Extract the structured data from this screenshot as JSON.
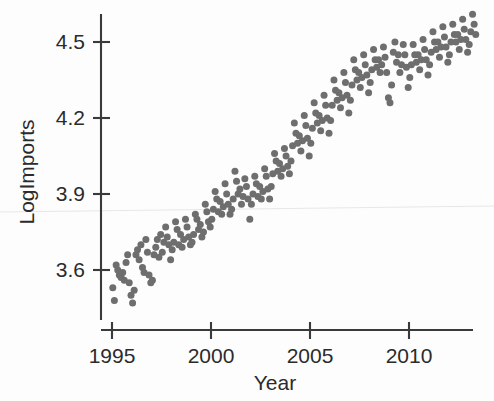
{
  "chart_data": {
    "type": "scatter",
    "title": "",
    "xlabel": "Year",
    "ylabel": "LogImports",
    "xlim": [
      1994.6,
      2013.6
    ],
    "ylim": [
      3.42,
      4.64
    ],
    "xticks": [
      1995,
      2000,
      2005,
      2010
    ],
    "xticklabels": [
      "1995",
      "2000",
      "2005",
      "2010"
    ],
    "yticks": [
      3.6,
      3.9,
      4.2,
      4.5
    ],
    "yticklabels": [
      "3.6",
      "3.9",
      "4.2",
      "4.5"
    ],
    "grid": false,
    "legend": null,
    "marker": {
      "shape": "circle",
      "color": "#6e6e6e",
      "size": 7
    },
    "points": [
      [
        1995.04,
        3.53
      ],
      [
        1995.12,
        3.48
      ],
      [
        1995.21,
        3.62
      ],
      [
        1995.29,
        3.6
      ],
      [
        1995.37,
        3.58
      ],
      [
        1995.46,
        3.57
      ],
      [
        1995.54,
        3.59
      ],
      [
        1995.62,
        3.56
      ],
      [
        1995.71,
        3.63
      ],
      [
        1995.79,
        3.66
      ],
      [
        1995.87,
        3.55
      ],
      [
        1995.96,
        3.5
      ],
      [
        1996.04,
        3.47
      ],
      [
        1996.12,
        3.52
      ],
      [
        1996.21,
        3.66
      ],
      [
        1996.29,
        3.68
      ],
      [
        1996.37,
        3.64
      ],
      [
        1996.46,
        3.7
      ],
      [
        1996.54,
        3.61
      ],
      [
        1996.62,
        3.59
      ],
      [
        1996.71,
        3.72
      ],
      [
        1996.79,
        3.67
      ],
      [
        1996.87,
        3.58
      ],
      [
        1996.96,
        3.55
      ],
      [
        1997.04,
        3.56
      ],
      [
        1997.12,
        3.66
      ],
      [
        1997.21,
        3.69
      ],
      [
        1997.29,
        3.72
      ],
      [
        1997.37,
        3.65
      ],
      [
        1997.46,
        3.74
      ],
      [
        1997.54,
        3.67
      ],
      [
        1997.62,
        3.71
      ],
      [
        1997.71,
        3.77
      ],
      [
        1997.79,
        3.73
      ],
      [
        1997.87,
        3.7
      ],
      [
        1997.96,
        3.64
      ],
      [
        1998.04,
        3.68
      ],
      [
        1998.12,
        3.71
      ],
      [
        1998.21,
        3.79
      ],
      [
        1998.29,
        3.76
      ],
      [
        1998.37,
        3.7
      ],
      [
        1998.46,
        3.74
      ],
      [
        1998.54,
        3.69
      ],
      [
        1998.62,
        3.72
      ],
      [
        1998.71,
        3.8
      ],
      [
        1998.79,
        3.77
      ],
      [
        1998.87,
        3.73
      ],
      [
        1998.96,
        3.7
      ],
      [
        1999.04,
        3.71
      ],
      [
        1999.12,
        3.74
      ],
      [
        1999.21,
        3.82
      ],
      [
        1999.29,
        3.8
      ],
      [
        1999.37,
        3.76
      ],
      [
        1999.46,
        3.78
      ],
      [
        1999.54,
        3.73
      ],
      [
        1999.62,
        3.75
      ],
      [
        1999.71,
        3.86
      ],
      [
        1999.79,
        3.83
      ],
      [
        1999.87,
        3.79
      ],
      [
        1999.96,
        3.77
      ],
      [
        2000.04,
        3.8
      ],
      [
        2000.12,
        3.84
      ],
      [
        2000.21,
        3.91
      ],
      [
        2000.29,
        3.88
      ],
      [
        2000.37,
        3.83
      ],
      [
        2000.46,
        3.87
      ],
      [
        2000.54,
        3.82
      ],
      [
        2000.62,
        3.85
      ],
      [
        2000.71,
        3.94
      ],
      [
        2000.79,
        3.9
      ],
      [
        2000.87,
        3.86
      ],
      [
        2000.96,
        3.82
      ],
      [
        2001.04,
        3.84
      ],
      [
        2001.12,
        3.88
      ],
      [
        2001.21,
        3.99
      ],
      [
        2001.29,
        3.95
      ],
      [
        2001.37,
        3.9
      ],
      [
        2001.46,
        3.92
      ],
      [
        2001.54,
        3.86
      ],
      [
        2001.62,
        3.89
      ],
      [
        2001.71,
        3.96
      ],
      [
        2001.79,
        3.93
      ],
      [
        2001.87,
        3.88
      ],
      [
        2001.96,
        3.8
      ],
      [
        2002.04,
        3.86
      ],
      [
        2002.12,
        3.9
      ],
      [
        2002.21,
        3.97
      ],
      [
        2002.29,
        3.94
      ],
      [
        2002.37,
        3.89
      ],
      [
        2002.46,
        3.93
      ],
      [
        2002.54,
        3.88
      ],
      [
        2002.62,
        3.91
      ],
      [
        2002.71,
        4.0
      ],
      [
        2002.79,
        3.97
      ],
      [
        2002.87,
        3.92
      ],
      [
        2002.96,
        3.88
      ],
      [
        2003.04,
        3.93
      ],
      [
        2003.12,
        3.98
      ],
      [
        2003.21,
        4.06
      ],
      [
        2003.29,
        4.03
      ],
      [
        2003.37,
        3.99
      ],
      [
        2003.46,
        4.02
      ],
      [
        2003.54,
        3.97
      ],
      [
        2003.62,
        4.0
      ],
      [
        2003.71,
        4.08
      ],
      [
        2003.79,
        4.05
      ],
      [
        2003.87,
        4.01
      ],
      [
        2003.96,
        3.98
      ],
      [
        2004.04,
        4.03
      ],
      [
        2004.12,
        4.09
      ],
      [
        2004.21,
        4.18
      ],
      [
        2004.29,
        4.14
      ],
      [
        2004.37,
        4.1
      ],
      [
        2004.46,
        4.13
      ],
      [
        2004.54,
        4.07
      ],
      [
        2004.62,
        4.11
      ],
      [
        2004.71,
        4.21
      ],
      [
        2004.79,
        4.17
      ],
      [
        2004.87,
        4.12
      ],
      [
        2004.96,
        4.05
      ],
      [
        2005.04,
        4.1
      ],
      [
        2005.12,
        4.16
      ],
      [
        2005.21,
        4.26
      ],
      [
        2005.29,
        4.22
      ],
      [
        2005.37,
        4.18
      ],
      [
        2005.46,
        4.21
      ],
      [
        2005.54,
        4.15
      ],
      [
        2005.62,
        4.19
      ],
      [
        2005.71,
        4.29
      ],
      [
        2005.79,
        4.25
      ],
      [
        2005.87,
        4.2
      ],
      [
        2005.96,
        4.14
      ],
      [
        2006.04,
        4.19
      ],
      [
        2006.12,
        4.25
      ],
      [
        2006.21,
        4.35
      ],
      [
        2006.29,
        4.31
      ],
      [
        2006.37,
        4.27
      ],
      [
        2006.46,
        4.3
      ],
      [
        2006.54,
        4.24
      ],
      [
        2006.62,
        4.28
      ],
      [
        2006.71,
        4.38
      ],
      [
        2006.79,
        4.34
      ],
      [
        2006.87,
        4.29
      ],
      [
        2006.96,
        4.22
      ],
      [
        2007.04,
        4.27
      ],
      [
        2007.12,
        4.33
      ],
      [
        2007.21,
        4.43
      ],
      [
        2007.29,
        4.39
      ],
      [
        2007.37,
        4.35
      ],
      [
        2007.46,
        4.38
      ],
      [
        2007.54,
        4.32
      ],
      [
        2007.62,
        4.36
      ],
      [
        2007.71,
        4.45
      ],
      [
        2007.79,
        4.41
      ],
      [
        2007.87,
        4.37
      ],
      [
        2007.96,
        4.3
      ],
      [
        2008.04,
        4.34
      ],
      [
        2008.12,
        4.39
      ],
      [
        2008.21,
        4.47
      ],
      [
        2008.29,
        4.43
      ],
      [
        2008.37,
        4.4
      ],
      [
        2008.46,
        4.43
      ],
      [
        2008.54,
        4.38
      ],
      [
        2008.62,
        4.41
      ],
      [
        2008.71,
        4.48
      ],
      [
        2008.79,
        4.44
      ],
      [
        2008.87,
        4.38
      ],
      [
        2008.96,
        4.28
      ],
      [
        2009.04,
        4.26
      ],
      [
        2009.12,
        4.33
      ],
      [
        2009.21,
        4.46
      ],
      [
        2009.29,
        4.5
      ],
      [
        2009.37,
        4.42
      ],
      [
        2009.46,
        4.45
      ],
      [
        2009.54,
        4.38
      ],
      [
        2009.62,
        4.41
      ],
      [
        2009.71,
        4.49
      ],
      [
        2009.79,
        4.45
      ],
      [
        2009.87,
        4.4
      ],
      [
        2009.96,
        4.32
      ],
      [
        2010.04,
        4.36
      ],
      [
        2010.12,
        4.41
      ],
      [
        2010.21,
        4.49
      ],
      [
        2010.29,
        4.45
      ],
      [
        2010.37,
        4.42
      ],
      [
        2010.46,
        4.45
      ],
      [
        2010.54,
        4.39
      ],
      [
        2010.62,
        4.43
      ],
      [
        2010.71,
        4.51
      ],
      [
        2010.79,
        4.47
      ],
      [
        2010.87,
        4.43
      ],
      [
        2010.96,
        4.37
      ],
      [
        2011.04,
        4.41
      ],
      [
        2011.12,
        4.46
      ],
      [
        2011.21,
        4.54
      ],
      [
        2011.29,
        4.5
      ],
      [
        2011.37,
        4.47
      ],
      [
        2011.46,
        4.5
      ],
      [
        2011.54,
        4.44
      ],
      [
        2011.62,
        4.48
      ],
      [
        2011.71,
        4.56
      ],
      [
        2011.79,
        4.52
      ],
      [
        2011.87,
        4.48
      ],
      [
        2011.96,
        4.42
      ],
      [
        2012.04,
        4.45
      ],
      [
        2012.12,
        4.5
      ],
      [
        2012.21,
        4.57
      ],
      [
        2012.29,
        4.53
      ],
      [
        2012.37,
        4.5
      ],
      [
        2012.46,
        4.53
      ],
      [
        2012.54,
        4.47
      ],
      [
        2012.62,
        4.51
      ],
      [
        2012.71,
        4.59
      ],
      [
        2012.79,
        4.55
      ],
      [
        2012.87,
        4.51
      ],
      [
        2012.96,
        4.46
      ],
      [
        2013.04,
        4.49
      ],
      [
        2013.12,
        4.54
      ],
      [
        2013.21,
        4.61
      ],
      [
        2013.29,
        4.57
      ],
      [
        2013.37,
        4.53
      ]
    ]
  }
}
